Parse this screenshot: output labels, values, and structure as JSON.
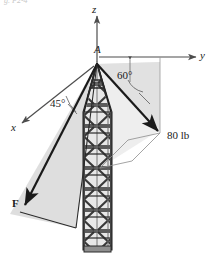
{
  "figure": {
    "title_fragment": "g. P2-4",
    "axes": {
      "z": "z",
      "y": "y",
      "x": "x"
    },
    "points": {
      "apex": "A"
    },
    "angles": {
      "from_z_to_80lb": "60°",
      "from_x_to_F": "45°"
    },
    "forces": [
      {
        "name": "80-lb-force",
        "label": "80 lb"
      },
      {
        "name": "F-force",
        "label": "F"
      }
    ],
    "colors": {
      "shade_fill": "#d9d9d9",
      "shade_fill_light": "#e6e6e6",
      "line": "#1a1a1a",
      "axis": "#4d4d4d",
      "tower_dark": "#3a3a3a",
      "tower_mid": "#8a8a8a",
      "tower_light": "#cfcfcf",
      "background": "#ffffff"
    }
  }
}
